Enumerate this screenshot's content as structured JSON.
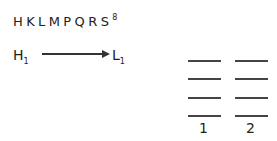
{
  "title": {
    "text": "HKLMPQRS",
    "superscript": "8"
  },
  "transition": {
    "from": {
      "label": "H",
      "subscript": "1"
    },
    "to": {
      "label": "L",
      "subscript": "1"
    },
    "arrow": "right-arrow"
  },
  "level_diagram": {
    "columns": [
      {
        "label": "1",
        "levels": 4
      },
      {
        "label": "2",
        "levels": 4
      }
    ]
  }
}
